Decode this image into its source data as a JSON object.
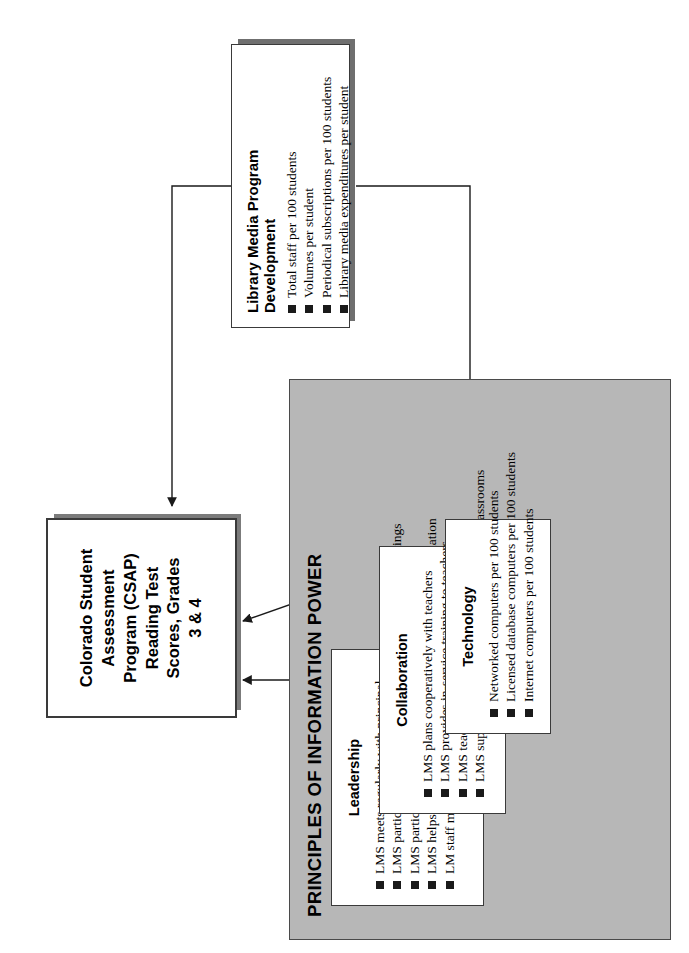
{
  "figure": {
    "number": "Figure 3",
    "title_line1": "How School",
    "title_line2": "Librarians Help Kids",
    "title_line3": "Achieve Standards",
    "subtitle_prefix": "The 2",
    "subtitle_sup": "nd",
    "subtitle_suffix": " Colorado Study"
  },
  "outcome": {
    "label": "Colorado Student Assessment Program (CSAP) Reading Test Scores, Grades 3 & 4",
    "line1": "Colorado Student",
    "line2": "Assessment",
    "line3": "Program (CSAP)",
    "line4": "Reading Test",
    "line5": "Scores, Grades",
    "line6": "3 & 4"
  },
  "principles": {
    "heading": "PRINCIPLES OF INFORMATION POWER",
    "groups": [
      {
        "title": "Leadership",
        "items": [
          "LMS meets regularly with principal",
          "LMS participates in standards & curriculum committee meetings",
          "LMS participates in faculty meetings",
          "LMS helps teachers access & use standards & related information",
          "LM staff meet at building & district levels & beyond"
        ]
      },
      {
        "title": "Collaboration",
        "items": [
          "LMS plans cooperatively with teachers",
          "LMS provides in-service training to teachers",
          "LMS teaches information literacy to students",
          "LMS supports network links between LMC & classrooms"
        ]
      },
      {
        "title": "Technology",
        "items": [
          "Networked computers per 100 students",
          "Licensed database computers per 100 students",
          "Internet computers per 100 students"
        ]
      }
    ]
  },
  "program_development": {
    "title": "Library Media Program Development",
    "items": [
      "Total staff per 100 students",
      "Volumes per student",
      "Periodical subscriptions per 100 students",
      "Library media expenditures per student"
    ]
  },
  "colors": {
    "panel_gray": "#b7b7b7",
    "shadow_gray": "#6f6f6f",
    "line_black": "#1a1a1a",
    "page_white": "#ffffff"
  },
  "connections": [
    {
      "from": "Leadership",
      "to": "Collaboration"
    },
    {
      "from": "Collaboration",
      "to": "Colorado Student Assessment Program (CSAP) Reading Test Scores, Grades 3 & 4"
    },
    {
      "from": "Technology",
      "to": "Colorado Student Assessment Program (CSAP) Reading Test Scores, Grades 3 & 4"
    },
    {
      "from": "Library Media Program Development",
      "to": "Technology"
    },
    {
      "from": "Library Media Program Development",
      "to": "Colorado Student Assessment Program (CSAP) Reading Test Scores, Grades 3 & 4"
    }
  ]
}
